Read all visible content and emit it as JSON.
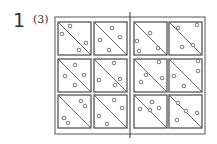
{
  "problem": {
    "number": "1",
    "subpart": "(3)"
  },
  "diagram": {
    "line_color": "#555555",
    "frame": {
      "x": 55,
      "y": 17,
      "w": 150,
      "h": 117
    },
    "divider": {
      "x": 130,
      "y1": 12,
      "y2": 138
    },
    "cell_size": 33,
    "columns_x": [
      58,
      94,
      134,
      169
    ],
    "rows_y": [
      22,
      59,
      95
    ],
    "cells": [
      {
        "row": 0,
        "col": 0,
        "dots": [
          [
            12,
            4
          ],
          [
            4,
            12
          ],
          [
            28,
            21
          ],
          [
            21,
            28
          ]
        ]
      },
      {
        "row": 0,
        "col": 1,
        "dots": [
          [
            18,
            6
          ],
          [
            6,
            18
          ],
          [
            26,
            15
          ],
          [
            15,
            28
          ]
        ]
      },
      {
        "row": 0,
        "col": 2,
        "dots": [
          [
            16,
            11
          ],
          [
            3,
            19
          ],
          [
            5,
            29
          ],
          [
            24,
            26
          ]
        ]
      },
      {
        "row": 0,
        "col": 3,
        "dots": [
          [
            9,
            6
          ],
          [
            28,
            3
          ],
          [
            13,
            25
          ],
          [
            24,
            23
          ]
        ]
      },
      {
        "row": 1,
        "col": 0,
        "dots": [
          [
            17,
            6
          ],
          [
            7,
            17
          ],
          [
            26,
            16
          ],
          [
            17,
            26
          ]
        ]
      },
      {
        "row": 1,
        "col": 1,
        "dots": [
          [
            20,
            4
          ],
          [
            5,
            21
          ],
          [
            26,
            20
          ],
          [
            21,
            26
          ]
        ]
      },
      {
        "row": 1,
        "col": 2,
        "dots": [
          [
            25,
            3
          ],
          [
            12,
            16
          ],
          [
            28,
            19
          ],
          [
            7,
            23
          ]
        ]
      },
      {
        "row": 1,
        "col": 3,
        "dots": [
          [
            29,
            2
          ],
          [
            29,
            12
          ],
          [
            5,
            17
          ],
          [
            15,
            27
          ]
        ]
      },
      {
        "row": 2,
        "col": 0,
        "dots": [
          [
            23,
            6
          ],
          [
            27,
            11
          ],
          [
            6,
            23
          ],
          [
            10,
            28
          ]
        ]
      },
      {
        "row": 2,
        "col": 1,
        "dots": [
          [
            20,
            5
          ],
          [
            28,
            13
          ],
          [
            5,
            21
          ],
          [
            13,
            29
          ]
        ]
      },
      {
        "row": 2,
        "col": 2,
        "dots": [
          [
            18,
            7
          ],
          [
            6,
            14
          ],
          [
            16,
            15
          ],
          [
            25,
            13
          ]
        ]
      },
      {
        "row": 2,
        "col": 3,
        "dots": [
          [
            9,
            8
          ],
          [
            17,
            16
          ],
          [
            28,
            18
          ],
          [
            8,
            25
          ]
        ]
      }
    ]
  }
}
